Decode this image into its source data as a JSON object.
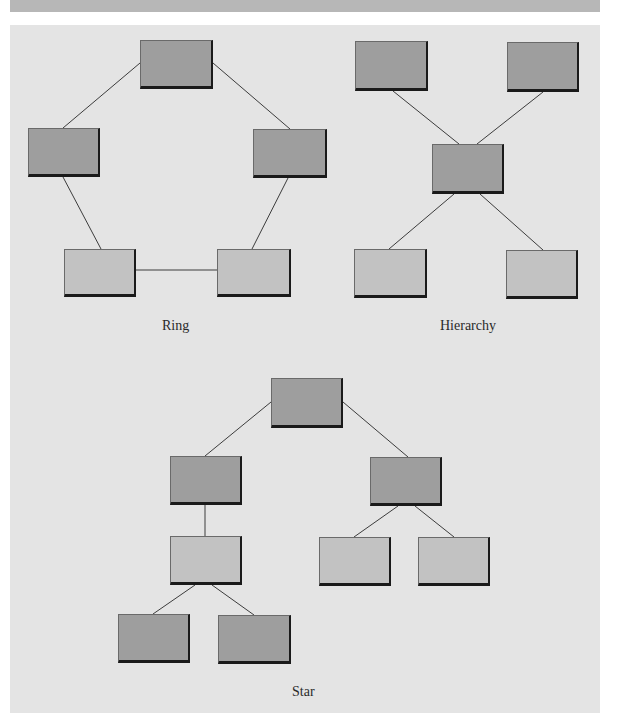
{
  "colors": {
    "panel_background": "#e4e4e4",
    "top_band": "#b7b7b7",
    "node_dark": "#9e9e9e",
    "node_light": "#c2c2c2",
    "edge": "#3c3c3c"
  },
  "diagrams": {
    "ring": {
      "label": "Ring",
      "nodes": [
        {
          "id": "ring-top",
          "shade": "dark",
          "x": 140,
          "y": 40,
          "w": 73,
          "h": 49
        },
        {
          "id": "ring-left",
          "shade": "dark",
          "x": 28,
          "y": 128,
          "w": 72,
          "h": 49
        },
        {
          "id": "ring-right",
          "shade": "dark",
          "x": 253,
          "y": 129,
          "w": 74,
          "h": 49
        },
        {
          "id": "ring-bottom-left",
          "shade": "light",
          "x": 64,
          "y": 249,
          "w": 72,
          "h": 48
        },
        {
          "id": "ring-bottom-right",
          "shade": "light",
          "x": 217,
          "y": 249,
          "w": 74,
          "h": 48
        }
      ],
      "edges": [
        {
          "from": "ring-top",
          "to": "ring-left"
        },
        {
          "from": "ring-top",
          "to": "ring-right"
        },
        {
          "from": "ring-left",
          "to": "ring-bottom-left"
        },
        {
          "from": "ring-right",
          "to": "ring-bottom-right"
        },
        {
          "from": "ring-bottom-left",
          "to": "ring-bottom-right"
        }
      ]
    },
    "hierarchy": {
      "label": "Hierarchy",
      "nodes": [
        {
          "id": "hier-top-left",
          "shade": "dark",
          "x": 355,
          "y": 41,
          "w": 73,
          "h": 50
        },
        {
          "id": "hier-top-right",
          "shade": "dark",
          "x": 507,
          "y": 42,
          "w": 72,
          "h": 50
        },
        {
          "id": "hier-center",
          "shade": "dark",
          "x": 432,
          "y": 144,
          "w": 72,
          "h": 50
        },
        {
          "id": "hier-bottom-left",
          "shade": "light",
          "x": 354,
          "y": 249,
          "w": 73,
          "h": 49
        },
        {
          "id": "hier-bottom-right",
          "shade": "light",
          "x": 506,
          "y": 250,
          "w": 72,
          "h": 49
        }
      ],
      "edges": [
        {
          "from": "hier-top-left",
          "to": "hier-center"
        },
        {
          "from": "hier-top-right",
          "to": "hier-center"
        },
        {
          "from": "hier-center",
          "to": "hier-bottom-left"
        },
        {
          "from": "hier-center",
          "to": "hier-bottom-right"
        }
      ]
    },
    "star": {
      "label": "Star",
      "nodes": [
        {
          "id": "star-root",
          "shade": "dark",
          "x": 271,
          "y": 378,
          "w": 72,
          "h": 50
        },
        {
          "id": "star-left-1",
          "shade": "dark",
          "x": 170,
          "y": 456,
          "w": 72,
          "h": 49
        },
        {
          "id": "star-right-1",
          "shade": "dark",
          "x": 370,
          "y": 457,
          "w": 72,
          "h": 49
        },
        {
          "id": "star-left-2",
          "shade": "light",
          "x": 170,
          "y": 536,
          "w": 72,
          "h": 49
        },
        {
          "id": "star-right-2a",
          "shade": "light",
          "x": 319,
          "y": 537,
          "w": 72,
          "h": 49
        },
        {
          "id": "star-right-2b",
          "shade": "light",
          "x": 418,
          "y": 537,
          "w": 72,
          "h": 49
        },
        {
          "id": "star-left-3a",
          "shade": "dark",
          "x": 118,
          "y": 614,
          "w": 72,
          "h": 49
        },
        {
          "id": "star-left-3b",
          "shade": "dark",
          "x": 218,
          "y": 615,
          "w": 73,
          "h": 49
        }
      ],
      "edges": [
        {
          "from": "star-root",
          "to": "star-left-1"
        },
        {
          "from": "star-root",
          "to": "star-right-1"
        },
        {
          "from": "star-left-1",
          "to": "star-left-2"
        },
        {
          "from": "star-left-2",
          "to": "star-left-3a"
        },
        {
          "from": "star-left-2",
          "to": "star-left-3b"
        },
        {
          "from": "star-right-1",
          "to": "star-right-2a"
        },
        {
          "from": "star-right-1",
          "to": "star-right-2b"
        }
      ]
    }
  }
}
